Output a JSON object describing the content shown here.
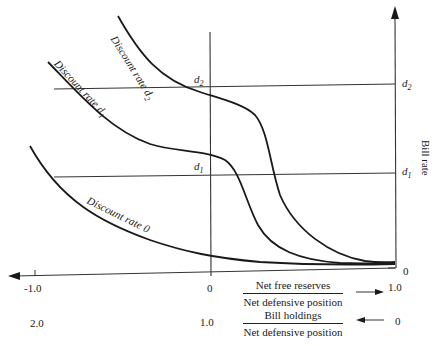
{
  "diagram": {
    "type": "economic-curve-diagram",
    "y_axis": {
      "label": "Bill rate",
      "ticks": [
        {
          "label": "d",
          "sub": "2",
          "level": "d2"
        },
        {
          "label": "d",
          "sub": "1",
          "level": "d1"
        },
        {
          "label": "0",
          "level": "0"
        }
      ]
    },
    "inner_axis_labels": [
      {
        "label": "d",
        "sub": "2"
      },
      {
        "label": "d",
        "sub": "1"
      }
    ],
    "x_axis_top": {
      "ticks": [
        "-1.0",
        "0",
        "1.0"
      ],
      "fraction": {
        "numerator": "Net free reserves",
        "denominator": "Net defensive position"
      },
      "arrow_direction": "right"
    },
    "x_axis_bottom": {
      "ticks": [
        "2.0",
        "1.0",
        "0"
      ],
      "fraction": {
        "numerator": "Bill holdings",
        "denominator": "Net defensive position"
      },
      "arrow_direction": "left"
    },
    "curves": [
      {
        "label": "Discount rate d",
        "sub": "2",
        "id": "d2"
      },
      {
        "label": "Discount rate d",
        "sub": "1",
        "id": "d1"
      },
      {
        "label": "Discount rate 0",
        "id": "zero"
      }
    ],
    "colors": {
      "line": "#1a1a1a",
      "background": "#ffffff"
    }
  }
}
